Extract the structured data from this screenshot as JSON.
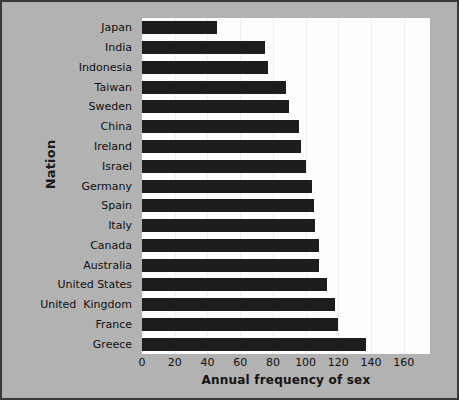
{
  "chart_data": {
    "type": "bar",
    "orientation": "horizontal",
    "title": "",
    "xlabel": "Annual frequency of sex",
    "ylabel": "Nation",
    "categories": [
      "Japan",
      "India",
      "Indonesia",
      "Taiwan",
      "Sweden",
      "China",
      "Ireland",
      "Israel",
      "Germany",
      "Spain",
      "Italy",
      "Canada",
      "Australia",
      "United States",
      "United  Kingdom",
      "France",
      "Greece"
    ],
    "values": [
      46,
      75,
      77,
      88,
      90,
      96,
      97,
      100,
      104,
      105,
      106,
      108,
      108,
      113,
      118,
      120,
      137
    ],
    "xlim": [
      0,
      176
    ],
    "xticks": [
      0,
      20,
      40,
      60,
      80,
      100,
      120,
      140,
      160
    ],
    "xticklabels": [
      "0",
      "20",
      "40",
      "60",
      "80",
      "100",
      "120",
      "140",
      "160"
    ],
    "grid": "vertical-light",
    "legend": "none",
    "bar_color": "#1d1d1d",
    "plot_background": "#fdfdfd",
    "figure_background": "#b2b2b2"
  },
  "bleed_text": [
    {
      "text": "the ground seem",
      "left": 300,
      "top": 218
    },
    {
      "text": "Some of the",
      "left": 305,
      "top": 235
    },
    {
      "text": "ds of the",
      "left": 318,
      "top": 252
    },
    {
      "text": "nce and Greece",
      "left": 300,
      "top": 269
    },
    {
      "text": "ung and 1998)",
      "left": 305,
      "top": 286
    },
    {
      "text": "ocial influence",
      "left": 300,
      "top": 303
    },
    {
      "text": "ppeared",
      "left": 236,
      "top": 180
    }
  ]
}
